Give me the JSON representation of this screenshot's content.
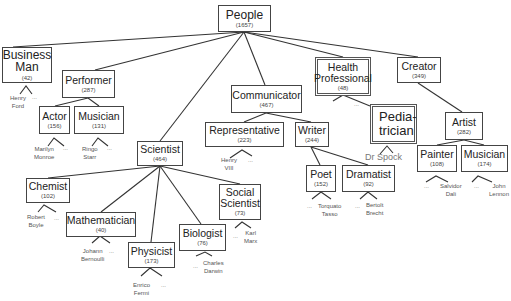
{
  "diagram": {
    "nodes": {
      "people": {
        "name": "People",
        "count": "(1657)"
      },
      "business_man": {
        "name_line1": "Business",
        "name_line2": "Man",
        "count": "(42)"
      },
      "performer": {
        "name": "Performer",
        "count": "(287)"
      },
      "actor": {
        "name": "Actor",
        "count": "(156)"
      },
      "performer_musician": {
        "name": "Musician",
        "count": "(131)"
      },
      "scientist": {
        "name": "Scientist",
        "count": "(464)"
      },
      "communicator": {
        "name": "Communicator",
        "count": "(467)"
      },
      "representative": {
        "name": "Representative",
        "count": "(223)"
      },
      "writer": {
        "name": "Writer",
        "count": "(244)"
      },
      "health_professional": {
        "name_line1": "Health",
        "name_line2": "Professional",
        "count": "(48)"
      },
      "pediatrician": {
        "name_line1": "Pedia-",
        "name_line2": "trician"
      },
      "creator": {
        "name": "Creator",
        "count": "(349)"
      },
      "artist": {
        "name": "Artist",
        "count": "(282)"
      },
      "painter": {
        "name": "Painter",
        "count": "(108)"
      },
      "artist_musician": {
        "name": "Musician",
        "count": "(174)"
      },
      "chemist": {
        "name": "Chemist",
        "count": "(102)"
      },
      "mathematician": {
        "name": "Mathematician",
        "count": "(40)"
      },
      "physicist": {
        "name": "Physicist",
        "count": "(173)"
      },
      "biologist": {
        "name": "Biologist",
        "count": "(76)"
      },
      "social_scientist": {
        "name_line1": "Social",
        "name_line2": "Scientist",
        "count": "(73)"
      },
      "poet": {
        "name": "Poet",
        "count": "(152)"
      },
      "dramatist": {
        "name": "Dramatist",
        "count": "(92)"
      }
    },
    "leaves": {
      "henry_ford": {
        "line1": "Henry",
        "line2": "Ford"
      },
      "marilyn_monroe": {
        "line1": "Marilyn",
        "line2": "Monroe"
      },
      "ringo_starr": {
        "line1": "Ringo",
        "line2": "Starr"
      },
      "henry_viii": {
        "line1": "Henry",
        "line2": "VIII"
      },
      "dr_spock": {
        "text": "Dr Spock"
      },
      "salvador_dali": {
        "line1": "Salvidor",
        "line2": "Dali"
      },
      "john_lennon": {
        "line1": "John",
        "line2": "Lennon"
      },
      "robert_boyle": {
        "line1": "Robert",
        "line2": "Boyle"
      },
      "johann_bernoulli": {
        "line1": "Johann",
        "line2": "Bernoulli"
      },
      "enrico_fermi": {
        "line1": "Enrico",
        "line2": "Fermi"
      },
      "charles_darwin": {
        "line1": "Charles",
        "line2": "Darwin"
      },
      "karl_marx": {
        "line1": "Karl",
        "line2": "Marx"
      },
      "torquato_tasso": {
        "line1": "Torquato",
        "line2": "Tasso"
      },
      "bertolt_brecht": {
        "line1": "Bertolt",
        "line2": "Brecht"
      }
    },
    "ellipsis": "..."
  }
}
